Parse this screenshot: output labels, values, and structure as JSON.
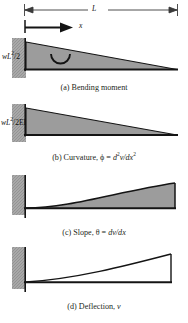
{
  "figure": {
    "type": "engineering-beam-diagram",
    "dimension_label": "L",
    "axis_label": "x"
  },
  "panels": [
    {
      "id": "a",
      "caption": "(a) Bending moment",
      "caption_prefix": "(a) Bending moment",
      "value_label_parts": {
        "lead": "wL",
        "exp": "2",
        "tail": "/2"
      },
      "value_label": "wL2/2",
      "shape": "triangle-taper-right",
      "filled": true,
      "has_moment_arc": true
    },
    {
      "id": "b",
      "caption_prefix": "(b) Curvature, ϕ = ",
      "caption_math_num": "d",
      "caption_math_num_exp": "2",
      "caption_math_num_var": "v",
      "caption_math_den": "/dx",
      "caption_math_den_exp": "2",
      "caption": "(b) Curvature, ϕ = d2v/dx2",
      "value_label_parts": {
        "lead": "wL",
        "exp": "2",
        "tail": "/2EI"
      },
      "value_label": "wL2/2EI",
      "shape": "triangle-taper-right",
      "filled": true,
      "has_moment_arc": false
    },
    {
      "id": "c",
      "caption_prefix": "(c) Slope, θ = ",
      "caption_math": "dv/dx",
      "caption": "(c) Slope, θ = dv/dx",
      "value_label": "",
      "shape": "concave-rise-flat-right",
      "filled": true,
      "has_moment_arc": false
    },
    {
      "id": "d",
      "caption_prefix": "(d) Deflection, ",
      "caption_math": "v",
      "caption": "(d) Deflection, v",
      "value_label": "",
      "shape": "near-linear-rise-flat-right",
      "filled": false,
      "has_moment_arc": false
    }
  ],
  "colors": {
    "fill_gray": "#9c9c9c",
    "wall_gray": "#a8a8a8",
    "line_black": "#141414",
    "text": "#231f20",
    "dimension_line": "#3a3a3a"
  }
}
